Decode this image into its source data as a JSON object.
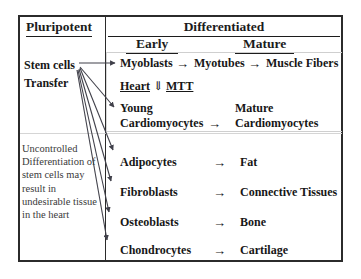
{
  "diagram": {
    "columns": {
      "pluripotent": "Pluripotent",
      "differentiated": "Differentiated",
      "early": "Early",
      "mature": "Mature"
    },
    "left_column": {
      "stem_cells": "Stem cells",
      "transfer": "Transfer",
      "note": "Uncontrolled Differentiation of stem cells may result in undesirable tissue in the heart"
    },
    "rows": [
      {
        "early": "Myoblasts",
        "arrow1": "→",
        "middle": "Myotubes",
        "arrow2": "→",
        "mature": "Muscle Fibers"
      },
      {
        "early_part1": "Heart",
        "down_arrow": "⇓",
        "early_part2": "MTT"
      },
      {
        "early_line1": "Young",
        "early_line2": "Cardiomyocytes",
        "arrow": "→",
        "mature_line1": "Mature",
        "mature_line2": "Cardiomyocytes"
      },
      {
        "early": "Adipocytes",
        "arrow": "→",
        "mature": "Fat"
      },
      {
        "early": "Fibroblasts",
        "arrow": "→",
        "mature": "Connective Tissues"
      },
      {
        "early": "Osteoblasts",
        "arrow": "→",
        "mature": "Bone"
      },
      {
        "early": "Chondrocytes",
        "arrow": "→",
        "mature": "Cartilage"
      }
    ],
    "colors": {
      "frame": "#2b2b2b",
      "text": "#171717",
      "note_text": "#3a3a3a",
      "inner_box": "#cfcfcf",
      "arrow": "#40404a"
    }
  }
}
